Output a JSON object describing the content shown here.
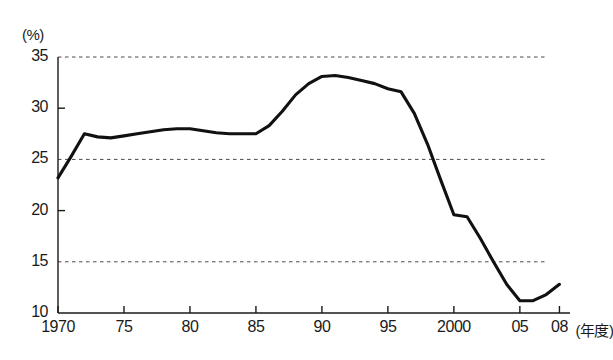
{
  "chart_data": {
    "type": "line",
    "title": "",
    "subtitle": "",
    "xlabel": "年度",
    "ylabel": "(%)",
    "yunit_label": "(%)",
    "xunit_label": "(年度)",
    "ylim": [
      10,
      35
    ],
    "xlim": [
      1970,
      2008.8
    ],
    "grid": "horizontal dashed at 15, 25, 35",
    "gridlines": [
      15,
      25,
      35
    ],
    "ytick_labels": [
      "10",
      "15",
      "20",
      "25",
      "30",
      "35"
    ],
    "ytick_values": [
      10,
      15,
      20,
      25,
      30,
      35
    ],
    "xtick_labels": [
      "1970",
      "75",
      "80",
      "85",
      "90",
      "95",
      "2000",
      "05",
      "08"
    ],
    "xtick_values": [
      1970,
      1975,
      1980,
      1985,
      1990,
      1995,
      2000,
      2005,
      2008
    ],
    "legend": [],
    "legend_position": "none",
    "line_color": "#111111",
    "series": [
      {
        "name": "",
        "x": [
          1970,
          1971,
          1972,
          1973,
          1974,
          1975,
          1976,
          1977,
          1978,
          1979,
          1980,
          1981,
          1982,
          1983,
          1984,
          1985,
          1986,
          1987,
          1988,
          1989,
          1990,
          1991,
          1992,
          1993,
          1994,
          1995,
          1996,
          1997,
          1998,
          1999,
          2000,
          2001,
          2002,
          2003,
          2004,
          2005,
          2006,
          2007,
          2008
        ],
        "values": [
          23.2,
          25.3,
          27.5,
          27.2,
          27.1,
          27.3,
          27.5,
          27.7,
          27.9,
          28.0,
          28.0,
          27.8,
          27.6,
          27.5,
          27.5,
          27.5,
          28.3,
          29.7,
          31.3,
          32.4,
          33.1,
          33.2,
          33.0,
          32.7,
          32.4,
          31.9,
          31.6,
          29.5,
          26.5,
          23.0,
          19.6,
          19.4,
          17.3,
          15.0,
          12.8,
          11.2,
          11.2,
          11.8,
          12.8
        ]
      }
    ]
  },
  "axes": {
    "y_unit": "(%)",
    "x_unit": "(年度)"
  }
}
